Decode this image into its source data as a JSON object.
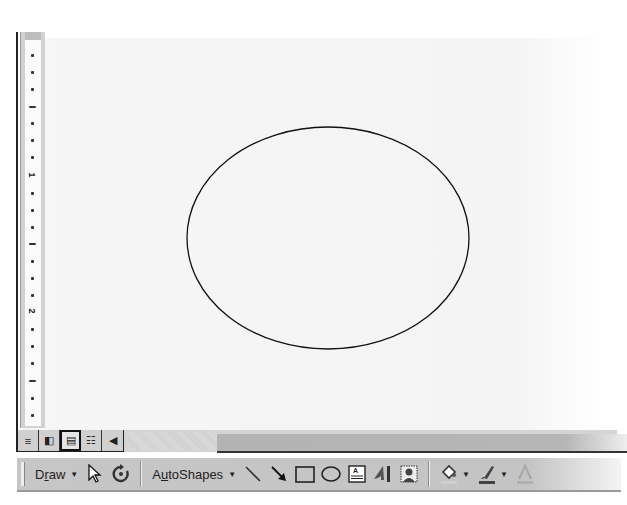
{
  "ruler": {
    "labels": [
      {
        "text": "1",
        "top": 178
      },
      {
        "text": "2",
        "top": 312
      }
    ]
  },
  "canvas": {
    "shape": "ellipse",
    "stroke": "#111111",
    "fill": "none"
  },
  "view_bar": {
    "buttons": [
      {
        "name": "normal-view",
        "glyph": "≡"
      },
      {
        "name": "web-layout-view",
        "glyph": "◧"
      },
      {
        "name": "print-layout-view",
        "glyph": "▤"
      },
      {
        "name": "outline-view",
        "glyph": "☷"
      }
    ],
    "scroll_left_glyph": "◀"
  },
  "draw_toolbar": {
    "draw_menu": {
      "label_pre": "D",
      "label_u": "r",
      "label_post": "aw",
      "caret": "▼"
    },
    "autoshapes_menu": {
      "label_pre": "A",
      "label_u": "u",
      "label_post": "toShapes",
      "caret": "▼"
    },
    "dropdown_caret": "▼"
  }
}
